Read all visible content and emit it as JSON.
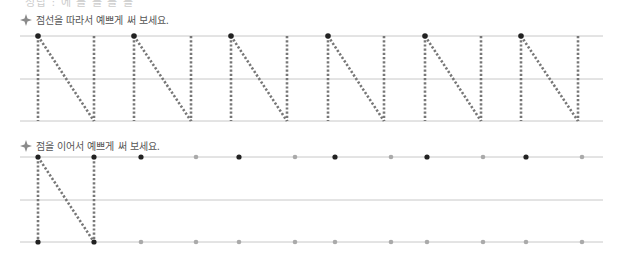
{
  "page": {
    "top_cut_text": "정답 : 에  를  를  를  를",
    "section1": {
      "instruction": "점선을 따라서 예쁘게 써 보세요.",
      "letter": "N",
      "letter_count": 6,
      "lefts": [
        38,
        134,
        231,
        328,
        425,
        521
      ],
      "rights": [
        94,
        191,
        287,
        384,
        481,
        578
      ],
      "lines_y": [
        36,
        79,
        121
      ]
    },
    "section2": {
      "instruction": "점을 이어서 예쁘게 써 보세요.",
      "example_letter": "N",
      "lines_y": [
        157,
        200,
        242
      ],
      "top_dots": [
        {
          "x": 38,
          "c": "#222"
        },
        {
          "x": 94,
          "c": "#222"
        },
        {
          "x": 141,
          "c": "#222"
        },
        {
          "x": 196,
          "c": "#aaa"
        },
        {
          "x": 239,
          "c": "#222"
        },
        {
          "x": 295,
          "c": "#aaa"
        },
        {
          "x": 335,
          "c": "#222"
        },
        {
          "x": 391,
          "c": "#aaa"
        },
        {
          "x": 427,
          "c": "#222"
        },
        {
          "x": 483,
          "c": "#aaa"
        },
        {
          "x": 526,
          "c": "#222"
        },
        {
          "x": 582,
          "c": "#aaa"
        }
      ],
      "bottom_dots": [
        {
          "x": 38,
          "c": "#222"
        },
        {
          "x": 94,
          "c": "#222"
        },
        {
          "x": 141,
          "c": "#aaa"
        },
        {
          "x": 196,
          "c": "#aaa"
        },
        {
          "x": 239,
          "c": "#aaa"
        },
        {
          "x": 295,
          "c": "#aaa"
        },
        {
          "x": 335,
          "c": "#aaa"
        },
        {
          "x": 391,
          "c": "#aaa"
        },
        {
          "x": 427,
          "c": "#aaa"
        },
        {
          "x": 483,
          "c": "#aaa"
        },
        {
          "x": 526,
          "c": "#aaa"
        },
        {
          "x": 582,
          "c": "#aaa"
        }
      ]
    },
    "colors": {
      "guide_line": "#c8c8c8",
      "dotted_stroke": "#777777",
      "start_dot": "#222222",
      "diamond": "#8a8a8a"
    }
  }
}
